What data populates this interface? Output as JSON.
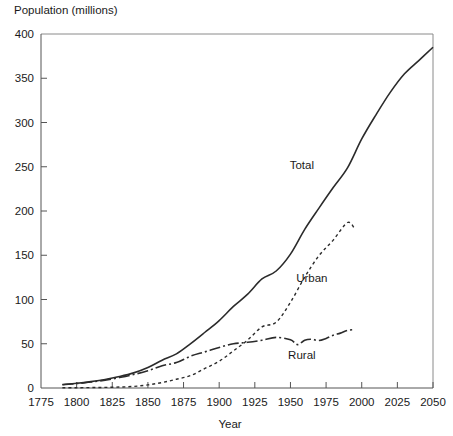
{
  "chart_data": {
    "type": "line",
    "title": "",
    "ylabel": "Population (millions)",
    "xlabel": "Year",
    "xlim": [
      1775,
      2050
    ],
    "ylim": [
      0,
      400
    ],
    "xticks": [
      1775,
      1800,
      1825,
      1850,
      1875,
      1900,
      1925,
      1950,
      1975,
      2000,
      2025,
      2050
    ],
    "yticks": [
      0,
      50,
      100,
      150,
      200,
      250,
      300,
      350,
      400
    ],
    "xtick_labels": [
      "1775",
      "1800",
      "1825",
      "1850",
      "1875",
      "1900",
      "1925",
      "1950",
      "1975",
      "2000",
      "2025",
      "2050"
    ],
    "ytick_labels": [
      "0",
      "50",
      "100",
      "150",
      "200",
      "250",
      "300",
      "350",
      "400"
    ],
    "grid": false,
    "legend_position": "inline-annotations",
    "series": [
      {
        "name": "Total",
        "style": "solid",
        "color": "#2b2b2b",
        "label_x": 1958,
        "label_y": 248,
        "x": [
          1790,
          1800,
          1810,
          1820,
          1830,
          1840,
          1850,
          1860,
          1870,
          1880,
          1890,
          1900,
          1910,
          1920,
          1930,
          1940,
          1950,
          1960,
          1970,
          1980,
          1990,
          2000,
          2010,
          2020,
          2030,
          2040,
          2050
        ],
        "y": [
          3.9,
          5.3,
          7.2,
          9.6,
          12.9,
          17.1,
          23.2,
          31.4,
          38.6,
          50.2,
          63.0,
          76.2,
          92.2,
          106.0,
          123.2,
          132.2,
          151.3,
          179.3,
          203.3,
          226.5,
          248.7,
          281.4,
          308.7,
          334.0,
          355.0,
          370.0,
          385.0
        ]
      },
      {
        "name": "Urban",
        "style": "dotted",
        "color": "#2b2b2b",
        "label_x": 1965,
        "label_y": 120,
        "x": [
          1790,
          1800,
          1810,
          1820,
          1830,
          1840,
          1850,
          1860,
          1870,
          1880,
          1890,
          1900,
          1910,
          1920,
          1930,
          1940,
          1950,
          1960,
          1970,
          1980,
          1990,
          1995
        ],
        "y": [
          0.2,
          0.3,
          0.5,
          0.7,
          1.1,
          1.8,
          3.5,
          6.2,
          9.9,
          14.1,
          22.1,
          30.2,
          42.0,
          54.2,
          69.0,
          74.4,
          96.8,
          125.3,
          149.6,
          167.1,
          187.0,
          180.0
        ]
      },
      {
        "name": "Rural",
        "style": "dash-dot",
        "color": "#2b2b2b",
        "label_x": 1958,
        "label_y": 33,
        "x": [
          1790,
          1800,
          1810,
          1820,
          1830,
          1840,
          1850,
          1860,
          1870,
          1880,
          1890,
          1900,
          1910,
          1920,
          1930,
          1940,
          1950,
          1955,
          1960,
          1965,
          1970,
          1975,
          1980,
          1985,
          1990,
          1995
        ],
        "y": [
          3.7,
          5.0,
          6.7,
          8.9,
          11.8,
          15.2,
          19.6,
          25.2,
          28.7,
          36.0,
          40.8,
          45.8,
          50.0,
          51.6,
          54.0,
          57.2,
          54.5,
          49.0,
          54.0,
          55.0,
          53.6,
          56.0,
          59.5,
          62.0,
          65.0,
          66.0
        ]
      }
    ]
  }
}
